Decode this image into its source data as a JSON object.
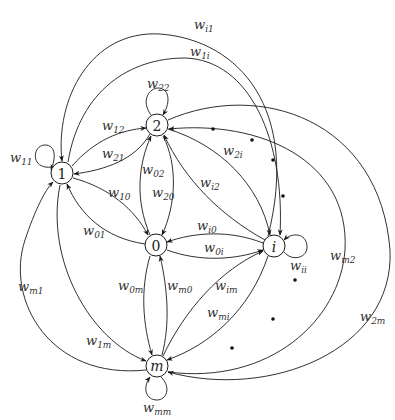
{
  "diagram": {
    "type": "directed-graph",
    "nodes": [
      {
        "id": "1",
        "label": "1",
        "x": 62,
        "y": 173
      },
      {
        "id": "2",
        "label": "2",
        "x": 157,
        "y": 125
      },
      {
        "id": "0",
        "label": "0",
        "x": 156,
        "y": 245
      },
      {
        "id": "i",
        "label": "i",
        "x": 274,
        "y": 246
      },
      {
        "id": "m",
        "label": "m",
        "x": 157,
        "y": 366
      }
    ],
    "edges": [
      {
        "from": "1",
        "to": "1",
        "label": "w",
        "sub": "11"
      },
      {
        "from": "2",
        "to": "2",
        "label": "w",
        "sub": "22"
      },
      {
        "from": "i",
        "to": "i",
        "label": "w",
        "sub": "ii"
      },
      {
        "from": "m",
        "to": "m",
        "label": "w",
        "sub": "mm"
      },
      {
        "from": "1",
        "to": "2",
        "label": "w",
        "sub": "12"
      },
      {
        "from": "2",
        "to": "1",
        "label": "w",
        "sub": "21"
      },
      {
        "from": "1",
        "to": "0",
        "label": "w",
        "sub": "10"
      },
      {
        "from": "0",
        "to": "1",
        "label": "w",
        "sub": "01"
      },
      {
        "from": "0",
        "to": "2",
        "label": "w",
        "sub": "02"
      },
      {
        "from": "2",
        "to": "0",
        "label": "w",
        "sub": "20"
      },
      {
        "from": "2",
        "to": "i",
        "label": "w",
        "sub": "2i"
      },
      {
        "from": "i",
        "to": "2",
        "label": "w",
        "sub": "i2"
      },
      {
        "from": "i",
        "to": "0",
        "label": "w",
        "sub": "i0"
      },
      {
        "from": "0",
        "to": "i",
        "label": "w",
        "sub": "0i"
      },
      {
        "from": "0",
        "to": "m",
        "label": "w",
        "sub": "0m"
      },
      {
        "from": "m",
        "to": "0",
        "label": "w",
        "sub": "m0"
      },
      {
        "from": "m",
        "to": "i",
        "label": "w",
        "sub": "im"
      },
      {
        "from": "i",
        "to": "m",
        "label": "w",
        "sub": "mi"
      },
      {
        "from": "m",
        "to": "1",
        "label": "w",
        "sub": "m1"
      },
      {
        "from": "1",
        "to": "m",
        "label": "w",
        "sub": "1m"
      },
      {
        "from": "i",
        "to": "1",
        "label": "w",
        "sub": "i1"
      },
      {
        "from": "1",
        "to": "i",
        "label": "w",
        "sub": "1i"
      },
      {
        "from": "m",
        "to": "2",
        "label": "w",
        "sub": "m2"
      },
      {
        "from": "2",
        "to": "m",
        "label": "w",
        "sub": "2m"
      }
    ],
    "ellipsis_dots": 7
  },
  "labels": {
    "n1": "1",
    "n2": "2",
    "n0": "0",
    "ni": "i",
    "nm": "m",
    "w": "w",
    "s11": "11",
    "s22": "22",
    "sii": "ii",
    "smm": "mm",
    "s12": "12",
    "s21": "21",
    "s10": "10",
    "s01": "01",
    "s02": "02",
    "s20": "20",
    "s2i": "2i",
    "si2": "i2",
    "si0": "i0",
    "s0i": "0i",
    "s0m": "0m",
    "sm0": "m0",
    "sim": "im",
    "smi": "mi",
    "sm1": "m1",
    "s1m": "1m",
    "si1": "i1",
    "s1i": "1i",
    "sm2": "m2",
    "s2m": "2m"
  }
}
